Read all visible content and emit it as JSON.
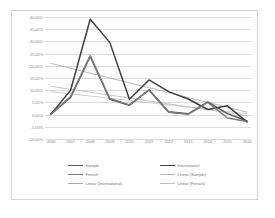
{
  "chart_data": {
    "type": "line",
    "title": "",
    "xlabel": "",
    "ylabel": "",
    "categories": [
      "2006",
      "2007",
      "2008",
      "2009",
      "2010",
      "2011",
      "2012",
      "2013",
      "2014",
      "2015",
      "2016"
    ],
    "ylim": [
      -10,
      40
    ],
    "yticks": [
      40,
      35,
      30,
      25,
      20,
      15,
      10,
      5,
      0,
      -5,
      -10
    ],
    "ytick_labels": [
      "40,00%",
      "35,00%",
      "30,00%",
      "25,00%",
      "20,00%",
      "15,00%",
      "10,00%",
      "5,00%",
      "0,00%",
      "-5,00%",
      "-10,00%"
    ],
    "grid": "horizontal",
    "legend_position": "bottom",
    "series": [
      {
        "name": "Sample",
        "kind": "data",
        "color": "#5a5a5a",
        "width": 1.5,
        "values": [
          0.2,
          7.0,
          23.8,
          6.3,
          3.8,
          10.2,
          1.2,
          0.3,
          5.2,
          0.4,
          -2.6
        ]
      },
      {
        "name": "International",
        "kind": "data",
        "color": "#3f3f3f",
        "width": 1.5,
        "values": [
          0.2,
          10.0,
          39.1,
          29.6,
          6.3,
          14.2,
          9.4,
          6.4,
          2.1,
          3.6,
          -3.0
        ]
      },
      {
        "name": "Finnish",
        "kind": "data",
        "color": "#7a7a7a",
        "width": 1.5,
        "values": [
          0.2,
          7.4,
          24.2,
          6.6,
          4.0,
          10.0,
          1.0,
          0.1,
          5.0,
          -1.4,
          -2.8
        ]
      },
      {
        "name": "Linear (Sample)",
        "kind": "trend",
        "color": "#b6b6b6",
        "width": 0.8,
        "values": [
          11.6,
          10.4,
          9.2,
          8.0,
          6.8,
          5.6,
          4.4,
          3.2,
          2.0,
          0.8,
          -0.4
        ]
      },
      {
        "name": "Linear (International)",
        "kind": "trend",
        "color": "#a8a8a8",
        "width": 0.8,
        "values": [
          21.0,
          19.0,
          17.0,
          15.0,
          13.0,
          11.0,
          9.0,
          7.0,
          5.0,
          3.0,
          1.0
        ]
      },
      {
        "name": "Linear (Finnish)",
        "kind": "trend",
        "color": "#c2c2c2",
        "width": 0.8,
        "values": [
          9.4,
          8.5,
          7.6,
          6.7,
          5.8,
          4.9,
          4.0,
          3.1,
          2.2,
          1.3,
          0.4
        ]
      }
    ]
  },
  "legend": {
    "entries": [
      {
        "label": "Sample",
        "color": "#5a5a5a",
        "style": "thick"
      },
      {
        "label": "International",
        "color": "#3f3f3f",
        "style": "thick"
      },
      {
        "label": "Finnish",
        "color": "#7a7a7a",
        "style": "thick"
      },
      {
        "label": "Linear (Sample)",
        "color": "#b6b6b6",
        "style": "thin"
      },
      {
        "label": "Linear (International)",
        "color": "#a8a8a8",
        "style": "thin"
      },
      {
        "label": "Linear (Finnish)",
        "color": "#c2c2c2",
        "style": "thin"
      }
    ]
  }
}
